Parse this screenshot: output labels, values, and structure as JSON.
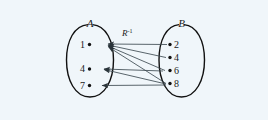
{
  "figure": {
    "type": "relation-mapping-diagram",
    "relation_label": "R",
    "relation_exponent": "-1",
    "sets": [
      {
        "name": "set-a",
        "label": "A",
        "elements": [
          "1",
          "4",
          "7"
        ]
      },
      {
        "name": "set-b",
        "label": "B",
        "elements": [
          "2",
          "4",
          "6",
          "8"
        ]
      }
    ],
    "arrows": [
      {
        "from": "2",
        "to": "1"
      },
      {
        "from": "4",
        "to": "1"
      },
      {
        "from": "6",
        "to": "1"
      },
      {
        "from": "8",
        "to": "1"
      },
      {
        "from": "6",
        "to": "4"
      },
      {
        "from": "8",
        "to": "4"
      },
      {
        "from": "8",
        "to": "7"
      }
    ],
    "colors": {
      "background": "#f0f6fa",
      "outline": "#111111",
      "arrow": "#3d4a52",
      "text": "#1a1a1a"
    }
  }
}
